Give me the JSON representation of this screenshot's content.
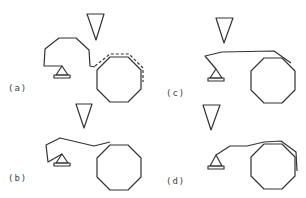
{
  "figure": {
    "panels": [
      {
        "id": "a",
        "label": "(a)",
        "label_pos": [
          8,
          83
        ]
      },
      {
        "id": "b",
        "label": "(b)",
        "label_pos": [
          8,
          173
        ]
      },
      {
        "id": "c",
        "label": "(c)",
        "label_pos": [
          166,
          88
        ]
      },
      {
        "id": "d",
        "label": "(d)",
        "label_pos": [
          166,
          176
        ]
      }
    ],
    "colors": {
      "stroke": "#333333",
      "background": "#ffffff"
    }
  }
}
